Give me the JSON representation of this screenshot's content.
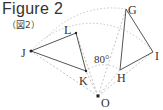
{
  "figure": {
    "title": "Figure 2",
    "subtitle": "（図2）"
  },
  "angle_label": "80°",
  "points": {
    "O": {
      "label": "O",
      "x": 98,
      "y": 96
    },
    "J": {
      "label": "J",
      "x": 31,
      "y": 51
    },
    "L": {
      "label": "L",
      "x": 76,
      "y": 33
    },
    "K": {
      "label": "K",
      "x": 86,
      "y": 71
    },
    "G": {
      "label": "G",
      "x": 126,
      "y": 9
    },
    "I": {
      "label": "I",
      "x": 153,
      "y": 52
    },
    "H": {
      "label": "H",
      "x": 120,
      "y": 70
    }
  },
  "triangles": [
    {
      "name": "JLK",
      "vertices": [
        "J",
        "L",
        "K"
      ]
    },
    {
      "name": "GIH",
      "vertices": [
        "G",
        "I",
        "H"
      ]
    }
  ],
  "rotation": {
    "center": "O",
    "angle": "80°"
  },
  "colors": {
    "solid_line": "#555555",
    "dashed_line": "#b0b0b0",
    "text": "#333333"
  }
}
